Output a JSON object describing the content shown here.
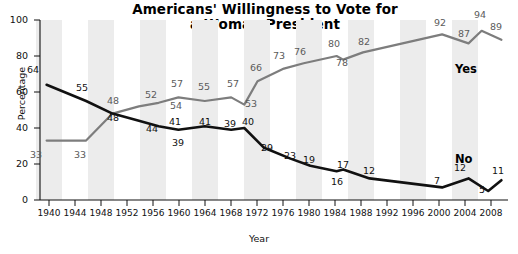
{
  "chart_data": {
    "type": "line",
    "title": "Americans'  Willingness to Vote for a Woman President",
    "title_line1": "Americans'  Willingness to Vote for",
    "title_line2": "a Woman President",
    "xlabel": "Year",
    "ylabel": "Percentage",
    "ylim": [
      0,
      100
    ],
    "yticks": [
      0,
      20,
      40,
      60,
      80,
      100
    ],
    "xlim": [
      1938,
      2009
    ],
    "xticks": [
      1940,
      1944,
      1948,
      1952,
      1956,
      1960,
      1964,
      1968,
      1972,
      1976,
      1980,
      1984,
      1988,
      1992,
      1996,
      2000,
      2004,
      2008
    ],
    "grid": false,
    "banded_background": true,
    "legend_position": "inline-right",
    "series": [
      {
        "name": "Yes",
        "color": "#7d7d7d",
        "label_position": {
          "x": 455,
          "y": 62
        },
        "points": [
          {
            "x": 1939,
            "y": 33,
            "label": "33",
            "lx": 36,
            "ly": 155
          },
          {
            "x": 1945,
            "y": 33,
            "label": "33",
            "lx": 80,
            "ly": 155
          },
          {
            "x": 1949,
            "y": 48,
            "label": "48",
            "lx": 113,
            "ly": 101
          },
          {
            "x": 1953,
            "y": 52,
            "label": "52",
            "lx": 151,
            "ly": 95
          },
          {
            "x": 1956,
            "y": 54,
            "label": "54",
            "lx": 176,
            "ly": 106
          },
          {
            "x": 1959,
            "y": 57,
            "label": "57",
            "lx": 177,
            "ly": 84
          },
          {
            "x": 1963,
            "y": 55,
            "label": "55",
            "lx": 204,
            "ly": 87
          },
          {
            "x": 1967,
            "y": 57,
            "label": "57",
            "lx": 233,
            "ly": 84
          },
          {
            "x": 1969,
            "y": 53,
            "label": "53",
            "lx": 251,
            "ly": 104
          },
          {
            "x": 1971,
            "y": 66,
            "label": "66",
            "lx": 256,
            "ly": 68
          },
          {
            "x": 1975,
            "y": 73,
            "label": "73",
            "lx": 279,
            "ly": 56
          },
          {
            "x": 1978,
            "y": 76,
            "label": "76",
            "lx": 300,
            "ly": 52
          },
          {
            "x": 1983,
            "y": 80,
            "label": "80",
            "lx": 334,
            "ly": 44
          },
          {
            "x": 1984,
            "y": 78,
            "label": "78",
            "lx": 342,
            "ly": 63
          },
          {
            "x": 1987,
            "y": 82,
            "label": "82",
            "lx": 364,
            "ly": 42
          },
          {
            "x": 1999,
            "y": 92,
            "label": "92",
            "lx": 440,
            "ly": 23
          },
          {
            "x": 2003,
            "y": 87,
            "label": "87",
            "lx": 464,
            "ly": 34
          },
          {
            "x": 2005,
            "y": 94,
            "label": "94",
            "lx": 480,
            "ly": 15
          },
          {
            "x": 2008,
            "y": 89,
            "label": "89",
            "lx": 496,
            "ly": 27
          }
        ]
      },
      {
        "name": "No",
        "color": "#111111",
        "label_position": {
          "x": 455,
          "y": 152
        },
        "points": [
          {
            "x": 1939,
            "y": 64,
            "label": "64",
            "lx": 33,
            "ly": 70
          },
          {
            "x": 1945,
            "y": 55,
            "label": "55",
            "lx": 82,
            "ly": 88
          },
          {
            "x": 1949,
            "y": 48,
            "label": "48",
            "lx": 113,
            "ly": 118
          },
          {
            "x": 1953,
            "y": 44,
            "label": "44",
            "lx": 152,
            "ly": 129
          },
          {
            "x": 1956,
            "y": 41,
            "label": "41",
            "lx": 175,
            "ly": 122
          },
          {
            "x": 1959,
            "y": 39,
            "label": "39",
            "lx": 178,
            "ly": 143
          },
          {
            "x": 1963,
            "y": 41,
            "label": "41",
            "lx": 205,
            "ly": 122
          },
          {
            "x": 1967,
            "y": 39,
            "label": "39",
            "lx": 230,
            "ly": 124
          },
          {
            "x": 1969,
            "y": 40,
            "label": "40",
            "lx": 248,
            "ly": 122
          },
          {
            "x": 1972,
            "y": 29,
            "label": "29",
            "lx": 267,
            "ly": 148
          },
          {
            "x": 1976,
            "y": 23,
            "label": "23",
            "lx": 290,
            "ly": 156
          },
          {
            "x": 1979,
            "y": 19,
            "label": "19",
            "lx": 309,
            "ly": 160
          },
          {
            "x": 1983,
            "y": 16,
            "label": "16",
            "lx": 337,
            "ly": 182
          },
          {
            "x": 1984,
            "y": 17,
            "label": "17",
            "lx": 343,
            "ly": 165
          },
          {
            "x": 1988,
            "y": 12,
            "label": "12",
            "lx": 369,
            "ly": 171
          },
          {
            "x": 1999,
            "y": 7,
            "label": "7",
            "lx": 437,
            "ly": 181
          },
          {
            "x": 2003,
            "y": 12,
            "label": "12",
            "lx": 460,
            "ly": 168
          },
          {
            "x": 2006,
            "y": 5,
            "label": "5",
            "lx": 482,
            "ly": 190
          },
          {
            "x": 2008,
            "y": 11,
            "label": "11",
            "lx": 498,
            "ly": 171
          }
        ]
      }
    ]
  },
  "yticks_px": [
    {
      "label": "100",
      "y": 20
    },
    {
      "label": "80",
      "y": 56
    },
    {
      "label": "60",
      "y": 92
    },
    {
      "label": "40",
      "y": 128
    },
    {
      "label": "20",
      "y": 164
    },
    {
      "label": "0",
      "y": 200
    }
  ],
  "xticks_px": [
    {
      "label": "1940",
      "x": 49
    },
    {
      "label": "1944",
      "x": 75
    },
    {
      "label": "1948",
      "x": 101
    },
    {
      "label": "1952",
      "x": 127
    },
    {
      "label": "1956",
      "x": 153
    },
    {
      "label": "1960",
      "x": 179
    },
    {
      "label": "1964",
      "x": 205
    },
    {
      "label": "1968",
      "x": 231
    },
    {
      "label": "1972",
      "x": 257
    },
    {
      "label": "1976",
      "x": 283
    },
    {
      "label": "1980",
      "x": 309
    },
    {
      "label": "1984",
      "x": 335
    },
    {
      "label": "1988",
      "x": 361
    },
    {
      "label": "1992",
      "x": 387
    },
    {
      "label": "1996",
      "x": 413
    },
    {
      "label": "2000",
      "x": 439
    },
    {
      "label": "2004",
      "x": 465
    },
    {
      "label": "2008",
      "x": 491
    }
  ]
}
